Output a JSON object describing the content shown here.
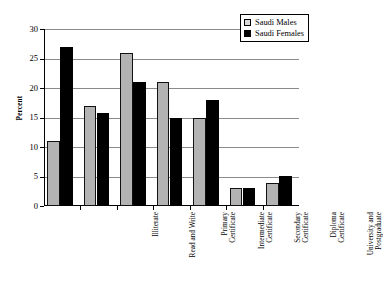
{
  "chart_data": {
    "type": "bar",
    "title": "",
    "xlabel": "",
    "ylabel": "Percent",
    "ylim": [
      0,
      30
    ],
    "yticks": [
      0,
      5,
      10,
      15,
      20,
      25,
      30
    ],
    "ytick_labels": [
      "0",
      "5",
      "10",
      "15",
      "20",
      "25",
      "30"
    ],
    "grid": true,
    "legend_position": "top-right",
    "categories": [
      "Illiterate",
      "Read and Write",
      "Primary Certificate",
      "Intermediate Certificate",
      "Secondary Certificate",
      "Diploma Certificate",
      "University and Postgraduate"
    ],
    "category_lines": [
      [
        "Illiterate"
      ],
      [
        "Read and Write"
      ],
      [
        "Primary",
        "Certificate"
      ],
      [
        "Intermediate",
        "Certificate"
      ],
      [
        "Secondary",
        "Certificate"
      ],
      [
        "Diploma",
        "Certificate"
      ],
      [
        "University and",
        "Postgraduate"
      ]
    ],
    "series": [
      {
        "name": "Saudi Males",
        "color": "#b3b3b3",
        "values": [
          11,
          17,
          26,
          21,
          15,
          3.1,
          3.9
        ]
      },
      {
        "name": "Saudi Females",
        "color": "#000000",
        "values": [
          27,
          15.8,
          21,
          15,
          18,
          3.0,
          5.1
        ]
      }
    ]
  },
  "legend": {
    "items": [
      {
        "label": "Saudi Males",
        "swatch": "male"
      },
      {
        "label": "Saudi Females",
        "swatch": "female"
      }
    ]
  },
  "colors": {
    "male_bar": "#b3b3b3",
    "female_bar": "#000000",
    "gridline": "#8a8a8a",
    "axis": "#000000",
    "background": "#ffffff"
  }
}
